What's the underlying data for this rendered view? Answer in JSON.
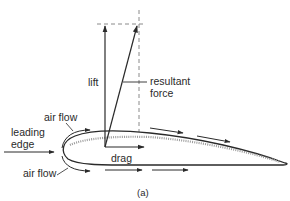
{
  "figure": {
    "caption": "(a)",
    "labels": {
      "lift": "lift",
      "resultant_line1": "resultant",
      "resultant_line2": "force",
      "drag": "drag",
      "air_flow_top": "air flow",
      "air_flow_bottom": "air flow",
      "leading_line1": "leading",
      "leading_line2": "edge"
    },
    "colors": {
      "stroke": "#2a2a2a",
      "dashed": "#8a8a8a",
      "stipple": "#9a9a9a",
      "background": "#ffffff"
    }
  }
}
